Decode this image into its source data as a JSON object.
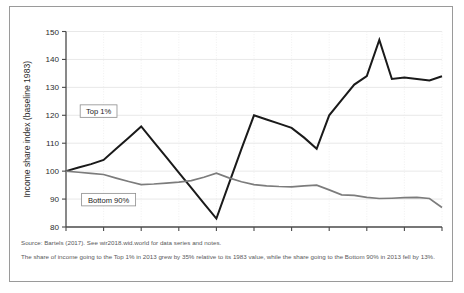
{
  "chart_data": {
    "type": "line",
    "title": "",
    "xlabel": "",
    "ylabel": "Income share index (baseline 1983)",
    "ylim": [
      80,
      150
    ],
    "xlim": [
      1983,
      2013
    ],
    "yticks": [
      80,
      90,
      100,
      110,
      120,
      130,
      140,
      150
    ],
    "xticks": [
      1983,
      1986,
      1989,
      1992,
      1995,
      1998,
      2001,
      2004,
      2007,
      2010,
      2013
    ],
    "grid": true,
    "legend_position": "inline-boxed-labels",
    "x": [
      1983,
      1984,
      1985,
      1986,
      1987,
      1988,
      1989,
      1990,
      1991,
      1992,
      1993,
      1994,
      1995,
      1996,
      1997,
      1998,
      1999,
      2000,
      2001,
      2002,
      2003,
      2004,
      2005,
      2006,
      2007,
      2008,
      2009,
      2010,
      2011,
      2012,
      2013
    ],
    "series": [
      {
        "name": "Top 1%",
        "color": "#1a1a1a",
        "values": [
          100,
          101.3,
          102.5,
          104,
          108,
          112,
          116,
          110.5,
          105,
          99.5,
          94,
          88.5,
          83,
          95.5,
          108,
          120,
          118.5,
          117,
          115.5,
          112,
          108,
          120,
          125.5,
          131,
          134,
          147,
          133,
          133.5,
          133,
          132.5,
          134
        ]
      },
      {
        "name": "Bottom 90%",
        "color": "#7c7c7c",
        "values": [
          100,
          99.6,
          99.2,
          98.8,
          97.5,
          96.3,
          95.2,
          95.4,
          95.7,
          96.1,
          96.6,
          97.8,
          99.3,
          97.6,
          96.2,
          95.2,
          94.7,
          94.5,
          94.4,
          94.7,
          95,
          93.3,
          91.5,
          91.3,
          90.6,
          90.2,
          90.3,
          90.5,
          90.6,
          90.2,
          87
        ]
      }
    ],
    "annotations": [
      {
        "text": "Top 1%",
        "x": 1985.6,
        "y": 121.5
      },
      {
        "text": "Bottom 90%",
        "x": 1986.4,
        "y": 89.8
      }
    ]
  },
  "footnotes": {
    "source": "Source: Bartels (2017). See wir2018.wid.world for data series and notes.",
    "note": "The share of income going to the Top 1% in 2013 grew by 35% relative to its 1983 value, while the share going to the Bottom 90% in 2013 fell by 13%."
  }
}
